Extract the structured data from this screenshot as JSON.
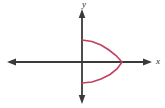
{
  "figure": {
    "title": "",
    "background_color": "#ffffff",
    "width": 165,
    "height": 108
  },
  "axes": {
    "label_x": "x",
    "label_y": "y",
    "axis_color": "#3a3a3a",
    "origin": {
      "x": 82,
      "y": 62
    },
    "x_axis": {
      "start_x": 7,
      "end_x": 152,
      "y": 62,
      "arrow_left": true,
      "arrow_right": true
    },
    "y_axis": {
      "start_y": 10,
      "end_y": 103,
      "x": 82,
      "arrow_up": true,
      "arrow_down": true
    }
  },
  "curve": {
    "name": "leftward-opening-parabola",
    "color": "#c0405f",
    "stroke_width": 1.6,
    "vertex": {
      "x": 122,
      "y": 62
    },
    "endpoint_top": {
      "x": 82,
      "y": 40
    },
    "endpoint_bottom": {
      "x": 82,
      "y": 83
    },
    "opens": "left"
  },
  "chart_data": {
    "type": "line",
    "title": "",
    "xlabel": "x",
    "ylabel": "y",
    "grid": false,
    "legend": null,
    "axis_style": "arrows-both-ends",
    "series": [
      {
        "name": "leftward-opening parabola",
        "color": "#c0405f",
        "description": "Parabola opening to the left with vertex on the positive x-axis; both branches terminate on the y-axis.",
        "vertex_pixels": [
          122,
          62
        ],
        "endpoints_pixels": [
          [
            82,
            40
          ],
          [
            82,
            83
          ]
        ],
        "points_pixels": [
          [
            82,
            40
          ],
          [
            92,
            41.5
          ],
          [
            101,
            45
          ],
          [
            109,
            50
          ],
          [
            116,
            55.5
          ],
          [
            121,
            61
          ],
          [
            122,
            62
          ],
          [
            121,
            63.5
          ],
          [
            117,
            69
          ],
          [
            110,
            74.5
          ],
          [
            101,
            79
          ],
          [
            92,
            82
          ],
          [
            82,
            83
          ]
        ]
      }
    ],
    "xlim": [
      7,
      152
    ],
    "ylim": [
      10,
      103
    ]
  }
}
